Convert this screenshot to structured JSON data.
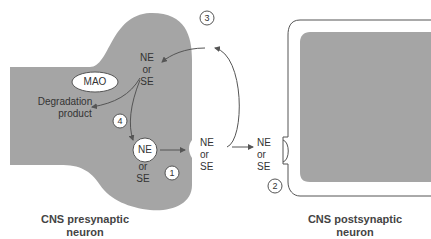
{
  "colors": {
    "cell_fill": "#a5a5a5",
    "line": "#555555",
    "text": "#333333"
  },
  "labels": {
    "ne_top": [
      "NE",
      "or",
      "SE"
    ],
    "mao": "MAO",
    "degradation": [
      "Degradation",
      "product"
    ],
    "vesicle_ne": "NE",
    "vesicle_or": "or",
    "vesicle_se": "SE",
    "cleft": [
      "NE",
      "or",
      "SE"
    ],
    "receptor": [
      "NE",
      "or",
      "SE"
    ]
  },
  "steps": [
    "1",
    "2",
    "3",
    "4"
  ],
  "captions": {
    "pre_line1": "CNS presynaptic",
    "pre_line2": "neuron",
    "post_line1": "CNS postsynaptic",
    "post_line2": "neuron"
  }
}
